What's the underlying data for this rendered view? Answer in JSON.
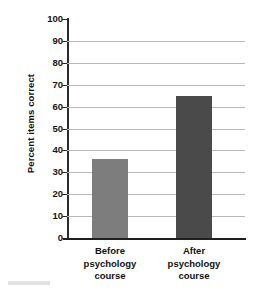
{
  "chart_data": {
    "type": "bar",
    "title": "",
    "xlabel": "",
    "ylabel": "Percent items correct",
    "categories": [
      "Before psychology course",
      "After psychology course"
    ],
    "category_lines": [
      [
        "Before",
        "psychology",
        "course"
      ],
      [
        "After",
        "psychology",
        "course"
      ]
    ],
    "values": [
      36,
      65
    ],
    "ylim": [
      0,
      100
    ],
    "yticks": [
      0,
      10,
      20,
      30,
      40,
      50,
      60,
      70,
      80,
      90,
      100
    ],
    "ytick_labels": [
      "0",
      "10",
      "20",
      "30",
      "40",
      "50",
      "60",
      "70",
      "80",
      "90",
      "100"
    ],
    "grid": true,
    "legend": "none",
    "bar_colors": [
      "#7d7d7d",
      "#4a4a4a"
    ],
    "axis_color": "#2b2b2b",
    "grid_color": "#b9b9b9",
    "background_color": "#ffffff"
  }
}
